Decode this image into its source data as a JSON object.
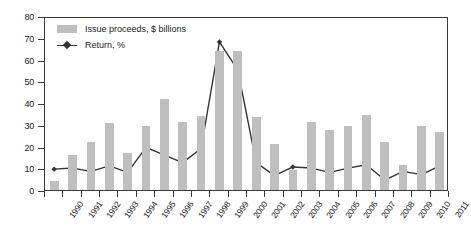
{
  "chart_data": {
    "type": "bar",
    "title": "",
    "subtitle": "",
    "xlabel": "",
    "ylabel": "",
    "ylim": [
      0,
      80
    ],
    "ytick_step": 10,
    "yticks": [
      0,
      10,
      20,
      30,
      40,
      50,
      60,
      70,
      80
    ],
    "grid": false,
    "legend_position": "top-left",
    "categories": [
      "1990",
      "1991",
      "1992",
      "1993",
      "1994",
      "1995",
      "1996",
      "1997",
      "1998",
      "1999",
      "2000",
      "2001",
      "2002",
      "2003",
      "2004",
      "2005",
      "2006",
      "2007",
      "2008",
      "2009",
      "2010",
      "2011"
    ],
    "series": [
      {
        "name": "Issue proceeds, $ billions",
        "type": "bar",
        "color": "#bfbfbf",
        "values": [
          4,
          16,
          22,
          31,
          17,
          29.5,
          42,
          31.5,
          34,
          64,
          64,
          33.5,
          21,
          9,
          31.5,
          27.5,
          29.5,
          34.5,
          22,
          11.5,
          29.5,
          26.5
        ]
      },
      {
        "name": "Return, %",
        "type": "line",
        "color": "#333333",
        "marker": "diamond",
        "values": [
          10.5,
          11,
          9.5,
          12,
          9,
          20.5,
          17,
          13.5,
          20,
          69,
          56,
          13.5,
          7.5,
          11.5,
          11,
          9,
          11,
          12.5,
          5.5,
          9.5,
          8,
          12
        ]
      }
    ],
    "colors": {
      "bar": "#bfbfbf",
      "line": "#333333",
      "axis": "#3a3a3a",
      "text": "#1a1a1a",
      "background": "#ffffff"
    }
  },
  "legend": {
    "items": [
      {
        "label": "Issue proceeds, $ billions",
        "swatch": "bar-swatch"
      },
      {
        "label": "Return, %",
        "swatch": "line-marker-swatch"
      }
    ]
  }
}
